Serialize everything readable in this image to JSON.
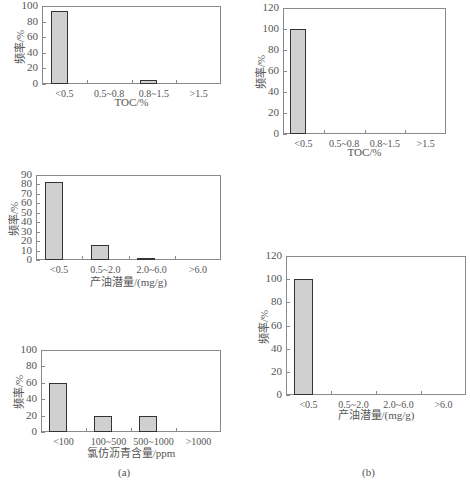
{
  "chart_data": [
    {
      "id": "a1",
      "type": "bar",
      "panel": "(a)",
      "title": "",
      "xlabel": "TOC/%",
      "ylabel": "频率/%",
      "categories": [
        "<0.5",
        "0.5~0.8",
        "0.8~1.5",
        ">1.5"
      ],
      "values": [
        94,
        0,
        5,
        0
      ],
      "ylim": [
        0,
        100
      ],
      "yticks": [
        "0",
        "20",
        "40",
        "60",
        "80",
        "100"
      ],
      "grid": false
    },
    {
      "id": "a2",
      "type": "bar",
      "panel": "(a)",
      "title": "",
      "xlabel": "产油潜量/(mg/g)",
      "ylabel": "频率/%",
      "categories": [
        "<0.5",
        "0.5~2.0",
        "2.0~6.0",
        ">6.0"
      ],
      "values": [
        83,
        16,
        2,
        0
      ],
      "ylim": [
        0,
        90
      ],
      "yticks": [
        "0",
        "10",
        "20",
        "30",
        "40",
        "50",
        "60",
        "70",
        "80",
        "90"
      ],
      "grid": false
    },
    {
      "id": "a3",
      "type": "bar",
      "panel": "(a)",
      "title": "",
      "xlabel": "氯仿沥青含量/ppm",
      "ylabel": "频率/%",
      "categories": [
        "<100",
        "100~500",
        "500~1000",
        ">1000"
      ],
      "values": [
        60,
        20,
        20,
        0
      ],
      "ylim": [
        0,
        100
      ],
      "yticks": [
        "0",
        "20",
        "40",
        "60",
        "80",
        "100"
      ],
      "grid": false
    },
    {
      "id": "b1",
      "type": "bar",
      "panel": "(b)",
      "title": "",
      "xlabel": "TOC/%",
      "ylabel": "频率/%",
      "categories": [
        "<0.5",
        "0.5~0.8",
        "0.8~1.5",
        ">1.5"
      ],
      "values": [
        100,
        0,
        0,
        0
      ],
      "ylim": [
        0,
        120
      ],
      "yticks": [
        "0",
        "20",
        "40",
        "60",
        "80",
        "100",
        "120"
      ],
      "grid": false
    },
    {
      "id": "b2",
      "type": "bar",
      "panel": "(b)",
      "title": "",
      "xlabel": "产油潜量/(mg/g)",
      "ylabel": "频率/%",
      "categories": [
        "<0.5",
        "0.5~2.0",
        "2.0~6.0",
        ">6.0"
      ],
      "values": [
        100,
        0,
        0,
        0
      ],
      "ylim": [
        0,
        120
      ],
      "yticks": [
        "0",
        "20",
        "40",
        "60",
        "80",
        "100",
        "120"
      ],
      "grid": false
    }
  ],
  "labels": {
    "panel_a": "(a)",
    "panel_b": "(b)"
  }
}
